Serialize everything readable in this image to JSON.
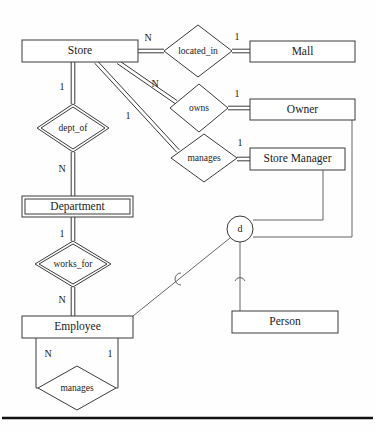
{
  "diagram": {
    "kind": "er-diagram",
    "title": "",
    "entities": [
      {
        "id": "store",
        "label": "Store",
        "type": "strong",
        "x": 22,
        "y": 40,
        "w": 116,
        "h": 22
      },
      {
        "id": "mall",
        "label": "Mall",
        "type": "strong",
        "x": 250,
        "y": 41,
        "w": 105,
        "h": 21
      },
      {
        "id": "owner",
        "label": "Owner",
        "type": "strong",
        "x": 250,
        "y": 99,
        "w": 105,
        "h": 21
      },
      {
        "id": "store_manager",
        "label": "Store Manager",
        "type": "strong",
        "x": 250,
        "y": 148,
        "w": 95,
        "h": 22
      },
      {
        "id": "department",
        "label": "Department",
        "type": "weak",
        "x": 22,
        "y": 196,
        "w": 111,
        "h": 21
      },
      {
        "id": "employee",
        "label": "Employee",
        "type": "strong",
        "x": 22,
        "y": 316,
        "w": 111,
        "h": 22
      },
      {
        "id": "person",
        "label": "Person",
        "type": "strong",
        "x": 232,
        "y": 311,
        "w": 106,
        "h": 22
      }
    ],
    "relationships": [
      {
        "id": "located_in",
        "label": "located_in",
        "type": "identifying-no",
        "cx": 198,
        "cy": 51,
        "rx": 34,
        "ry": 26
      },
      {
        "id": "owns",
        "label": "owns",
        "type": "identifying-no",
        "cx": 199,
        "cy": 108,
        "rx": 29,
        "ry": 24
      },
      {
        "id": "manages_store",
        "label": "manages",
        "type": "identifying-no",
        "cx": 204,
        "cy": 158,
        "rx": 33,
        "ry": 24
      },
      {
        "id": "dept_of",
        "label": "dept_of",
        "type": "identifying",
        "cx": 73,
        "cy": 128,
        "rx": 36,
        "ry": 24
      },
      {
        "id": "works_for",
        "label": "works_for",
        "type": "identifying",
        "cx": 73,
        "cy": 264,
        "rx": 38,
        "ry": 23
      },
      {
        "id": "manages_employee",
        "label": "manages",
        "type": "identifying-no",
        "cx": 77,
        "cy": 388,
        "rx": 39,
        "ry": 22
      }
    ],
    "cardinalities": [
      {
        "id": "store-located_in",
        "label": "N",
        "x": 148,
        "y": 39
      },
      {
        "id": "located_in-mall",
        "label": "1",
        "x": 237,
        "y": 38
      },
      {
        "id": "store-owns",
        "label": "N",
        "x": 155,
        "y": 85
      },
      {
        "id": "owns-owner",
        "label": "1",
        "x": 237,
        "y": 95
      },
      {
        "id": "store-manages",
        "label": "1",
        "x": 128,
        "y": 117
      },
      {
        "id": "manages-store_manager",
        "label": "1",
        "x": 240,
        "y": 144
      },
      {
        "id": "store-dept_of",
        "label": "1",
        "x": 62,
        "y": 88
      },
      {
        "id": "dept_of-department",
        "label": "N",
        "x": 62,
        "y": 170
      },
      {
        "id": "department-works_for",
        "label": "1",
        "x": 62,
        "y": 235
      },
      {
        "id": "works_for-employee",
        "label": "N",
        "x": 62,
        "y": 301
      },
      {
        "id": "employee-manages-n",
        "label": "N",
        "x": 48,
        "y": 355
      },
      {
        "id": "employee-manages-1",
        "label": "1",
        "x": 110,
        "y": 355
      }
    ],
    "specialization": {
      "id": "disjoint-circle",
      "label": "d",
      "cx": 240,
      "cy": 229,
      "r": 13,
      "superclass": "person",
      "subclasses": [
        "store_manager",
        "owner",
        "employee"
      ]
    }
  }
}
